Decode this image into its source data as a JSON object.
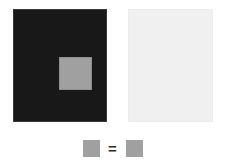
{
  "figure": {
    "name": "simultaneous-contrast-illusion",
    "background_color": "#ffffff",
    "width": 225,
    "height": 165
  },
  "panels": [
    {
      "id": "dark",
      "surround_label": "",
      "surround_color": "#181818",
      "border_color": "#3a3a3a",
      "patch_color": "#a0a0a0",
      "patch_label": ""
    },
    {
      "id": "light",
      "surround_label": "",
      "surround_color": "#f0f0f0",
      "border_color": "#ececec",
      "patch_color": "#a0a0a0",
      "patch_label": ""
    }
  ],
  "comparison": {
    "left_swatch_color": "#a0a0a0",
    "right_swatch_color": "#a0a0a0",
    "operator": "=",
    "operator_color": "#2b2b2b"
  },
  "chart_data": {
    "type": "heatmap",
    "title": "",
    "xlabel": "",
    "ylabel": "",
    "categories": [
      "patch on dark surround",
      "patch on light surround"
    ],
    "series": [
      {
        "name": "surround luminance (0-255)",
        "values": [
          24,
          240
        ]
      },
      {
        "name": "patch luminance (0-255)",
        "values": [
          160,
          160
        ]
      }
    ],
    "annotations": [
      "="
    ],
    "legend": []
  }
}
